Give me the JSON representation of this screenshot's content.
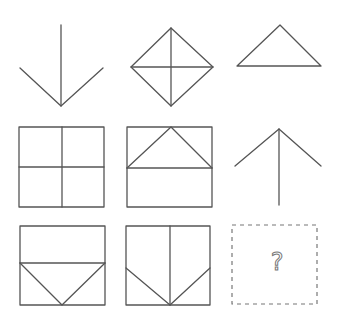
{
  "puzzle": {
    "type": "3x3 figure matrix",
    "stroke_color": "#555555",
    "cells": [
      {
        "row": 1,
        "col": 1,
        "shape": "downward arrow (vertical line with V at bottom)"
      },
      {
        "row": 1,
        "col": 2,
        "shape": "diamond with vertical and horizontal diagonals"
      },
      {
        "row": 1,
        "col": 3,
        "shape": "triangle (apex up)"
      },
      {
        "row": 2,
        "col": 1,
        "shape": "square divided into four quadrants"
      },
      {
        "row": 2,
        "col": 2,
        "shape": "square with horizontal midline and triangle in top half"
      },
      {
        "row": 2,
        "col": 3,
        "shape": "upward arrow (caret with vertical stem)"
      },
      {
        "row": 3,
        "col": 1,
        "shape": "square with horizontal line and inverted triangle in bottom half"
      },
      {
        "row": 3,
        "col": 2,
        "shape": "square with vertical midline and diagonals meeting at bottom center"
      },
      {
        "row": 3,
        "col": 3,
        "shape": "missing answer placeholder",
        "label": "?"
      }
    ]
  }
}
